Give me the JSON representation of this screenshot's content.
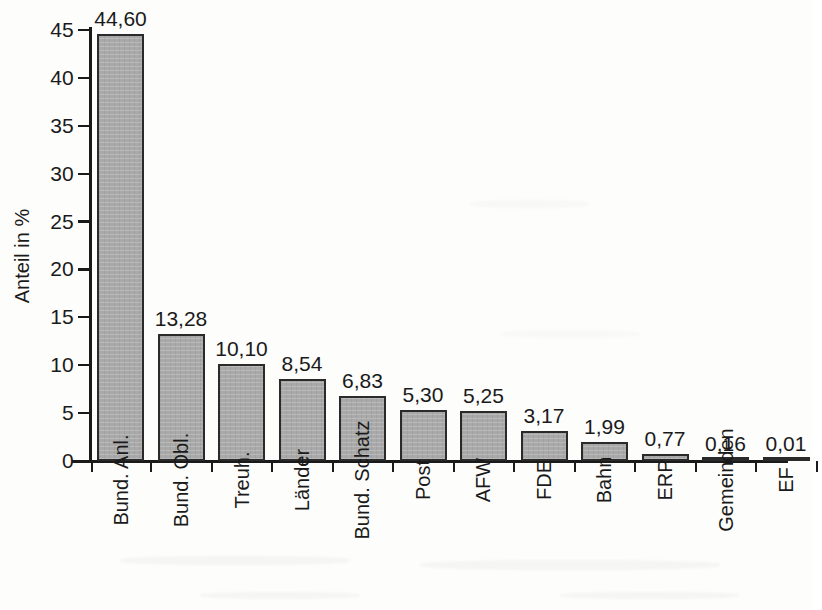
{
  "chart_data": {
    "type": "bar",
    "title": "",
    "xlabel": "",
    "ylabel": "Anteil in %",
    "ylim": [
      0,
      45
    ],
    "ytick_step": 5,
    "grid": false,
    "legend": null,
    "value_label_format": "comma-decimal",
    "categories": [
      "Bund. Anl.",
      "Bund. Obl.",
      "Treuh.",
      "Länder",
      "Bund. Schatz",
      "Post",
      "AFW",
      "FDE",
      "Bahn",
      "ERP",
      "Gemeinden",
      "EF"
    ],
    "values": [
      44.6,
      13.28,
      10.1,
      8.54,
      6.83,
      5.3,
      5.25,
      3.17,
      1.99,
      0.77,
      0.16,
      0.01
    ],
    "value_labels": [
      "44,60",
      "13,28",
      "10,10",
      "8,54",
      "6,83",
      "5,30",
      "5,25",
      "3,17",
      "1,99",
      "0,77",
      "0,16",
      "0,01"
    ],
    "ytick_labels": [
      "0",
      "5",
      "10",
      "15",
      "20",
      "25",
      "30",
      "35",
      "40",
      "45"
    ],
    "ytick_values": [
      0,
      5,
      10,
      15,
      20,
      25,
      30,
      35,
      40,
      45
    ],
    "colors": {
      "bar_fill": "#a9a9a9",
      "bar_border": "#2a2a2a",
      "axis": "#1a1a1a",
      "text": "#1a1a1a",
      "background": "#fdfdfc"
    }
  }
}
